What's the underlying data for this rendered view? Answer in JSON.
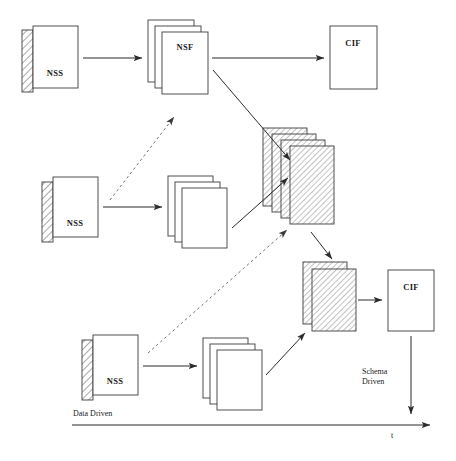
{
  "diagram": {
    "nodes": [
      {
        "id": "nss1",
        "label": "NSS",
        "kind": "schema-box",
        "x": 22,
        "y": 26,
        "w": 52,
        "h": 66
      },
      {
        "id": "nsf1",
        "label": "NSF",
        "kind": "sheet-stack",
        "x": 148,
        "y": 20,
        "w": 50,
        "h": 64,
        "sheets": 3
      },
      {
        "id": "cif1",
        "label": "CIF",
        "kind": "plain-box",
        "x": 330,
        "y": 26,
        "w": 48,
        "h": 64
      },
      {
        "id": "nss2",
        "label": "NSS",
        "kind": "schema-box",
        "x": 42,
        "y": 176,
        "w": 52,
        "h": 66
      },
      {
        "id": "stack2",
        "label": "",
        "kind": "sheet-stack",
        "x": 168,
        "y": 176,
        "w": 50,
        "h": 64,
        "sheets": 3
      },
      {
        "id": "hstack1",
        "label": "",
        "kind": "hatched-stack",
        "x": 263,
        "y": 128,
        "w": 52,
        "h": 82,
        "sheets": 4
      },
      {
        "id": "nss3",
        "label": "NSS",
        "kind": "schema-box",
        "x": 82,
        "y": 334,
        "w": 52,
        "h": 66
      },
      {
        "id": "stack3",
        "label": "",
        "kind": "sheet-stack",
        "x": 203,
        "y": 338,
        "w": 50,
        "h": 64,
        "sheets": 3
      },
      {
        "id": "hstack2",
        "label": "",
        "kind": "hatched-stack",
        "x": 303,
        "y": 262,
        "w": 50,
        "h": 66,
        "sheets": 2
      },
      {
        "id": "cif2",
        "label": "CIF",
        "kind": "plain-box",
        "x": 388,
        "y": 270,
        "w": 48,
        "h": 62
      }
    ],
    "connections": [
      {
        "from": "nss1",
        "to": "nsf1",
        "style": "solid"
      },
      {
        "from": "nsf1",
        "to": "cif1",
        "style": "solid"
      },
      {
        "from": "nsf1",
        "to": "hstack1",
        "style": "solid"
      },
      {
        "from": "nss2",
        "to": "stack2",
        "style": "solid"
      },
      {
        "from": "stack2",
        "to": "hstack1",
        "style": "solid"
      },
      {
        "from": "nss2",
        "to": "nsf1",
        "style": "dashed"
      },
      {
        "from": "nss3",
        "to": "stack3",
        "style": "solid"
      },
      {
        "from": "stack3",
        "to": "hstack2",
        "style": "solid"
      },
      {
        "from": "nss3",
        "to": "hstack1",
        "style": "dashed"
      },
      {
        "from": "hstack1",
        "to": "hstack2",
        "style": "solid"
      },
      {
        "from": "hstack2",
        "to": "cif2",
        "style": "solid"
      },
      {
        "from": "cif2",
        "to": "taxis",
        "style": "solid"
      }
    ],
    "annotations": {
      "data_driven": "Data Driven",
      "schema_driven_line1": "Schema",
      "schema_driven_line2": "Driven",
      "time_axis": "t"
    },
    "colors": {
      "background": "#ffffff",
      "stroke": "#3c3c3c",
      "connector": "#2b2b2b",
      "dashed_connector": "#6e6e6e",
      "text": "#1a1a1a",
      "hatch": "#555555"
    }
  }
}
